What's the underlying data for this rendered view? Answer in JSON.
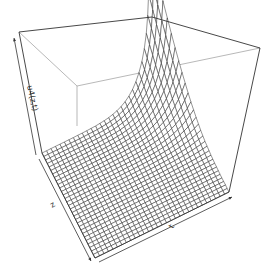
{
  "chart_data": {
    "type": "surface3d",
    "title": "",
    "xlabel": "z",
    "ylabel": "t",
    "zlabel": "u4(z,t)",
    "grid": {
      "nz": 30,
      "nt": 30
    },
    "ticks": "none (arrows only)",
    "box": true
  },
  "axes": {
    "z_label": "z",
    "t_label": "t",
    "u_label": "u4(z,t)"
  },
  "colors": {
    "line": "#2a2a2a",
    "box": "#333333",
    "hidden_box": "#9a9a9a",
    "surface_fill": "#ffffff",
    "background": "#ffffff"
  },
  "geometry": {
    "top_left": [
      19,
      32
    ],
    "top_back": [
      152,
      17
    ],
    "top_right": [
      260,
      48
    ],
    "inner_corner": [
      77,
      86
    ],
    "bottom_left": [
      42,
      153
    ],
    "bottom_front": [
      95,
      258
    ],
    "bottom_right": [
      229,
      192
    ]
  }
}
